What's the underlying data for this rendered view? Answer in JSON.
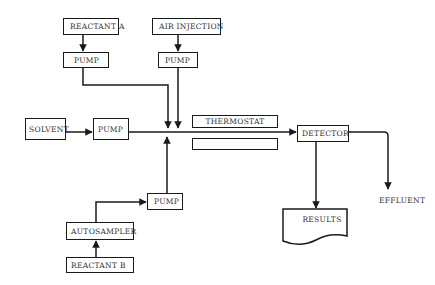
{
  "diagram": {
    "type": "flow-injection-analysis-schematic",
    "nodes": {
      "reactant_a": "REACTANT A",
      "air_injection": "AIR INJECTION",
      "pump_a": "PUMP",
      "pump_air": "PUMP",
      "solvent": "SOLVENT",
      "pump_solvent": "PUMP",
      "thermostat": "THERMOSTAT",
      "coil_box": "",
      "detector": "DETECTOR",
      "results": "RESULTS",
      "effluent": "EFFLUENT",
      "pump_sample": "PUMP",
      "autosampler": "AUTOSAMPLER",
      "reactant_b": "REACTANT B"
    },
    "edges": [
      {
        "from": "REACTANT A",
        "to": "PUMP (A)"
      },
      {
        "from": "AIR INJECTION",
        "to": "PUMP (air)"
      },
      {
        "from": "PUMP (A)",
        "to": "junction"
      },
      {
        "from": "PUMP (air)",
        "to": "junction"
      },
      {
        "from": "SOLVENT",
        "to": "PUMP (solvent)"
      },
      {
        "from": "PUMP (solvent)",
        "to": "DETECTOR",
        "via": "junction / THERMOSTAT"
      },
      {
        "from": "REACTANT B",
        "to": "AUTOSAMPLER"
      },
      {
        "from": "AUTOSAMPLER",
        "to": "PUMP (sample)"
      },
      {
        "from": "PUMP (sample)",
        "to": "junction"
      },
      {
        "from": "DETECTOR",
        "to": "RESULTS"
      },
      {
        "from": "DETECTOR",
        "to": "EFFLUENT"
      }
    ],
    "colors": {
      "line": "#1a1a1a",
      "text": "#333333",
      "background": "#ffffff"
    }
  }
}
